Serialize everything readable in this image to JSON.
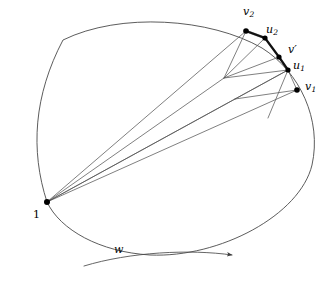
{
  "figure": {
    "background_color": "#ffffff",
    "stroke_color": "#3a3a3a",
    "highlight_stroke_color": "#1a1a1a",
    "gray_segment_color": "#9a9a9a",
    "point_color": "#000000",
    "width": 333,
    "height": 281
  },
  "labels": {
    "base_vertex": {
      "text": "1",
      "x": 33,
      "y": 209
    },
    "v2": {
      "base": "v",
      "sub": "2",
      "x": 243,
      "y": 6
    },
    "u2": {
      "base": "u",
      "sub": "2",
      "x": 266,
      "y": 24
    },
    "v_prime": {
      "base": "v",
      "prime": "′",
      "x": 288,
      "y": 44
    },
    "u1": {
      "base": "u",
      "sub": "1",
      "x": 293,
      "y": 60
    },
    "v1": {
      "base": "v",
      "sub": "1",
      "x": 305,
      "y": 81
    },
    "w": {
      "text": "w",
      "x": 114,
      "y": 244
    }
  },
  "points": [
    {
      "name": "base-vertex-1",
      "x": 47,
      "y": 202,
      "r": 3.0
    },
    {
      "name": "point-v2",
      "x": 246,
      "y": 31,
      "r": 2.8
    },
    {
      "name": "point-u2",
      "x": 265,
      "y": 38,
      "r": 2.6
    },
    {
      "name": "point-v-prime",
      "x": 279,
      "y": 57,
      "r": 2.6
    },
    {
      "name": "point-u1",
      "x": 288,
      "y": 70,
      "r": 2.6
    },
    {
      "name": "point-v1",
      "x": 297,
      "y": 90,
      "r": 2.8
    }
  ],
  "paths": {
    "closed_curve": "M 47 202 C 30 150 34 95 63 40 L 63 40 C 120 12 210 18 262 48 C 300 72 322 120 312 165 C 300 215 220 258 150 255 C 100 252 60 230 47 202 Z",
    "highlight_arc": "M 246 31 L 265 38 L 279 57 L 288 70",
    "gray_segment": "M 246 31 L 265 38",
    "w_arrow": "M 84 266 C 130 252 190 249 232 255"
  },
  "fan_edges": [
    {
      "name": "edge-1-to-v2",
      "x1": 47,
      "y1": 202,
      "x2": 246,
      "y2": 31
    },
    {
      "name": "edge-1-to-inner-a",
      "x1": 47,
      "y1": 202,
      "x2": 224,
      "y2": 78
    },
    {
      "name": "edge-1-to-u1",
      "x1": 47,
      "y1": 202,
      "x2": 288,
      "y2": 70
    },
    {
      "name": "edge-1-to-inner-b",
      "x1": 47,
      "y1": 202,
      "x2": 235,
      "y2": 99
    },
    {
      "name": "edge-1-to-v1",
      "x1": 47,
      "y1": 202,
      "x2": 297,
      "y2": 90
    }
  ],
  "inner_edges": [
    {
      "name": "edge-v2-to-inner-a",
      "x1": 246,
      "y1": 31,
      "x2": 224,
      "y2": 78
    },
    {
      "name": "edge-u2-to-inner-a",
      "x1": 265,
      "y1": 38,
      "x2": 224,
      "y2": 78
    },
    {
      "name": "edge-v-prime-to-inner-a",
      "x1": 279,
      "y1": 57,
      "x2": 224,
      "y2": 78
    },
    {
      "name": "edge-inner-a-to-u1",
      "x1": 224,
      "y1": 78,
      "x2": 288,
      "y2": 70
    },
    {
      "name": "edge-u1-to-inner-b",
      "x1": 288,
      "y1": 70,
      "x2": 235,
      "y2": 99
    },
    {
      "name": "edge-inner-b-to-v1",
      "x1": 235,
      "y1": 99,
      "x2": 297,
      "y2": 90
    },
    {
      "name": "edge-u1-to-v1",
      "x1": 288,
      "y1": 70,
      "x2": 297,
      "y2": 90
    },
    {
      "name": "edge-u1-down",
      "x1": 288,
      "y1": 70,
      "x2": 268,
      "y2": 118
    }
  ]
}
